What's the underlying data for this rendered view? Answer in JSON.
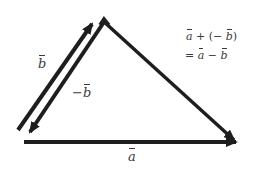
{
  "diagram": {
    "type": "vector-triangle",
    "colors": {
      "stroke": "#1e1e1e",
      "text": "#3a3a3a",
      "background": "#ffffff"
    },
    "vectors": [
      {
        "name": "b",
        "label": "b",
        "from": [
          17,
          130
        ],
        "to": [
          96,
          18
        ]
      },
      {
        "name": "neg-b",
        "label": "−b",
        "from": [
          104,
          20
        ],
        "to": [
          25,
          138
        ]
      },
      {
        "name": "a",
        "label": "a",
        "from": [
          24,
          142
        ],
        "to": [
          239,
          142
        ]
      },
      {
        "name": "a-minus-b",
        "label": "",
        "from": [
          104,
          20
        ],
        "to": [
          239,
          142
        ]
      }
    ],
    "labels": {
      "b": "b",
      "neg_b_sign": "−",
      "neg_b": "b",
      "a": "a"
    },
    "equation": {
      "line1": {
        "a": "a",
        "plus": "+",
        "open": "(",
        "minus": "−",
        "b": "b",
        "close": ")"
      },
      "line2": {
        "equals": "=",
        "a": "a",
        "minus": "−",
        "b": "b"
      }
    }
  }
}
